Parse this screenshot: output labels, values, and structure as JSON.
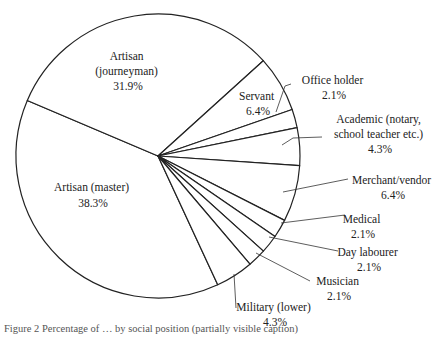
{
  "chart_data": {
    "type": "pie",
    "title": "",
    "slices": [
      {
        "label": "Artisan (master)",
        "value": 38.3
      },
      {
        "label": "Artisan (journeyman)",
        "value": 31.9
      },
      {
        "label": "Servant",
        "value": 6.4
      },
      {
        "label": "Office holder",
        "value": 2.1
      },
      {
        "label": "Academic (notary, school teacher etc.)",
        "value": 4.3
      },
      {
        "label": "Merchant/vendor",
        "value": 6.4
      },
      {
        "label": "Medical",
        "value": 2.1
      },
      {
        "label": "Day labourer",
        "value": 2.1
      },
      {
        "label": "Musician",
        "value": 2.1
      },
      {
        "label": "Military (lower)",
        "value": 4.3
      }
    ],
    "unit": "%",
    "colors": {
      "fill": "#ffffff",
      "stroke": "#222222"
    }
  },
  "labels": {
    "journeyman": [
      "Artisan",
      "(journeyman)",
      "31.9%"
    ],
    "master": [
      "Artisan (master)",
      "38.3%"
    ],
    "servant": [
      "Servant",
      "6.4%"
    ],
    "office": [
      "Office holder",
      "2.1%"
    ],
    "academic": [
      "Academic (notary,",
      "school teacher etc.)",
      "4.3%"
    ],
    "merchant": [
      "Merchant/vendor",
      "6.4%"
    ],
    "medical": [
      "Medical",
      "2.1%"
    ],
    "day": [
      "Day labourer",
      "2.1%"
    ],
    "musician": [
      "Musician",
      "2.1%"
    ],
    "military": [
      "Military (lower)",
      "4.3%"
    ]
  },
  "caption": "Figure 2 Percentage of … by social position (partially visible caption)"
}
